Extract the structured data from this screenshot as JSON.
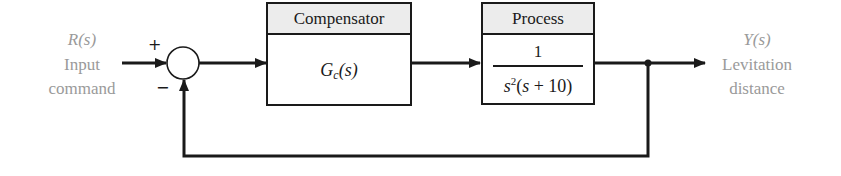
{
  "input": {
    "symbol": "R(s)",
    "line1": "Input",
    "line2": "command"
  },
  "output": {
    "symbol": "Y(s)",
    "line1": "Levitation",
    "line2": "distance"
  },
  "summing_junction": {
    "plus_sign": "+",
    "minus_sign": "−"
  },
  "compensator": {
    "header": "Compensator",
    "tf_main": "G",
    "tf_sub": "c",
    "tf_arg": "(s)"
  },
  "process": {
    "header": "Process",
    "numerator": "1",
    "den_s": "s",
    "den_exp": "2",
    "den_rest_open": "(",
    "den_rest_s": "s",
    "den_rest_close": " + 10)"
  },
  "colors": {
    "line": "#1a1a1a",
    "label": "#9a9a9a",
    "header_bg": "#ececec"
  }
}
